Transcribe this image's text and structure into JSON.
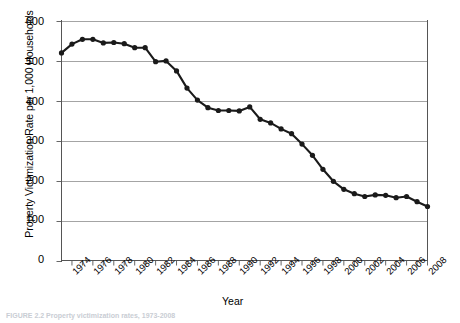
{
  "chart_data": {
    "type": "line",
    "title": "",
    "xlabel": "Year",
    "ylabel": "Property Victimization Rate per 1,000 Households",
    "ylim": [
      0,
      600
    ],
    "ytick_values": [
      0,
      100,
      200,
      300,
      400,
      500,
      600
    ],
    "ytick_labels": [
      "0",
      "100",
      "200",
      "300",
      "400",
      "500",
      "600"
    ],
    "xlim": [
      1973,
      2008
    ],
    "xtick_labels": [
      "1974",
      "1976",
      "1978",
      "1980",
      "1982",
      "1984",
      "1986",
      "1988",
      "1990",
      "1992",
      "1994",
      "1996",
      "1998",
      "2000",
      "2002",
      "2004",
      "2006",
      "2008"
    ],
    "grid": "horizontal",
    "legend": "none",
    "marker": "filled-circle",
    "line_color": "#1a1a1a",
    "grid_color": "#9a9a9a",
    "x": [
      1973,
      1974,
      1975,
      1976,
      1977,
      1978,
      1979,
      1980,
      1981,
      1982,
      1983,
      1984,
      1985,
      1986,
      1987,
      1988,
      1989,
      1990,
      1991,
      1992,
      1993,
      1994,
      1995,
      1996,
      1997,
      1998,
      1999,
      2000,
      2001,
      2002,
      2003,
      2004,
      2005,
      2006,
      2007,
      2008
    ],
    "values": [
      519,
      541,
      553,
      553,
      544,
      545,
      542,
      532,
      532,
      497,
      499,
      474,
      431,
      401,
      382,
      375,
      375,
      374,
      384,
      353,
      344,
      329,
      317,
      291,
      263,
      228,
      198,
      178,
      167,
      160,
      164,
      163,
      157,
      160,
      147,
      135
    ]
  },
  "caption": {
    "text": "FIGURE 2.2  Property victimization rates, 1973-2008"
  }
}
